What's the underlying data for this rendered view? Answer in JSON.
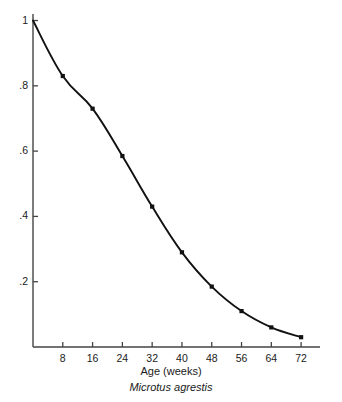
{
  "figure": {
    "axis_title": "Age (weeks)",
    "species_caption": "Microtus agrestis",
    "background_color": "#ffffff",
    "line_color": "#111111",
    "marker_color": "#111111",
    "axis_color": "#444444"
  },
  "chart_data": {
    "type": "line",
    "title": "",
    "subtitle": "",
    "xlabel": "Age (weeks)",
    "ylabel": "",
    "annotation": "Microtus agrestis",
    "grid": false,
    "legend": false,
    "legend_position": "none",
    "marker": "square",
    "xlim": [
      0,
      76
    ],
    "ylim": [
      0,
      1.02
    ],
    "x_ticks": [
      8,
      16,
      24,
      32,
      40,
      48,
      56,
      64,
      72
    ],
    "x_tick_labels": [
      "8",
      "16",
      "24",
      "32",
      "40",
      "48",
      "56",
      "64",
      "72"
    ],
    "y_ticks": [
      0.2,
      0.4,
      0.6,
      0.8,
      1.0
    ],
    "y_tick_labels": [
      ".2",
      ".4",
      ".6",
      ".8",
      "1"
    ],
    "x": [
      0,
      8,
      16,
      24,
      32,
      40,
      48,
      56,
      64,
      72
    ],
    "values": [
      1.0,
      0.83,
      0.73,
      0.585,
      0.43,
      0.29,
      0.185,
      0.11,
      0.06,
      0.03
    ],
    "series": [
      {
        "name": "Survivorship",
        "x": [
          0,
          8,
          16,
          24,
          32,
          40,
          48,
          56,
          64,
          72
        ],
        "values": [
          1.0,
          0.83,
          0.73,
          0.585,
          0.43,
          0.29,
          0.185,
          0.11,
          0.06,
          0.03
        ]
      }
    ]
  }
}
